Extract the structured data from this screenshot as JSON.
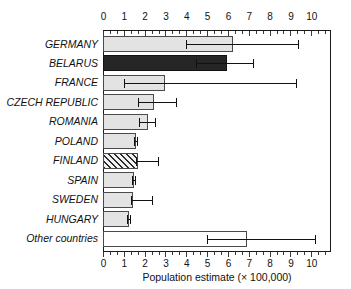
{
  "chart_data": {
    "type": "bar",
    "orientation": "horizontal",
    "title": "",
    "subtitle": "",
    "xlabel": "Population estimate (× 100,000)",
    "ylabel": "",
    "xlim": [
      0,
      10.9
    ],
    "xticks": [
      0,
      1,
      2,
      3,
      4,
      5,
      6,
      7,
      8,
      9,
      10
    ],
    "xtick_labels": [
      "0",
      "1",
      "2",
      "3",
      "4",
      "5",
      "6",
      "7",
      "8",
      "9",
      "10"
    ],
    "minor_ticks_per_interval": 2,
    "grid": false,
    "legend": null,
    "axis_duplicated_top": true,
    "categories": [
      "GERMANY",
      "BELARUS",
      "FRANCE",
      "CZECH REPUBLIC",
      "ROMANIA",
      "POLAND",
      "FINLAND",
      "SPAIN",
      "SWEDEN",
      "HUNGARY",
      "Other countries"
    ],
    "values": [
      6.2,
      5.9,
      2.95,
      2.4,
      2.1,
      1.55,
      1.65,
      1.45,
      1.4,
      1.2,
      6.85
    ],
    "error_low": [
      4.0,
      4.45,
      1.0,
      1.7,
      1.75,
      1.5,
      1.6,
      1.4,
      1.35,
      1.15,
      5.0
    ],
    "error_high": [
      9.35,
      7.2,
      9.25,
      3.5,
      2.5,
      1.65,
      2.65,
      1.55,
      2.35,
      1.3,
      10.2
    ],
    "bar_styles": [
      "fill-light",
      "fill-dark",
      "fill-light",
      "fill-light",
      "fill-light",
      "fill-light",
      "fill-hatch",
      "fill-light",
      "fill-light",
      "fill-light",
      "fill-white"
    ],
    "style_notes": {
      "light_gray": "#e3e3e3",
      "dark": "#262626",
      "white": "#ffffff",
      "hatched": "diagonal-hatch"
    }
  }
}
